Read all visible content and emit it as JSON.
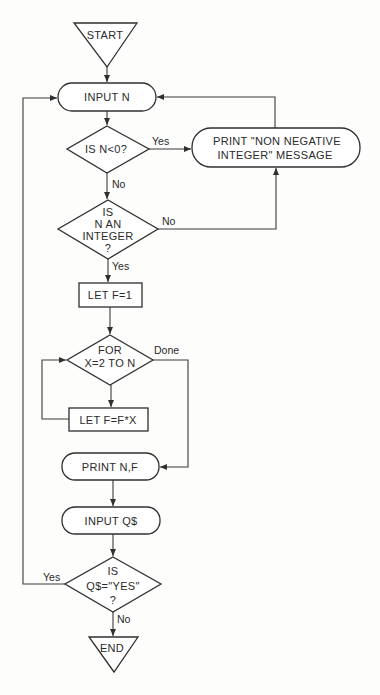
{
  "diagram": {
    "nodes": {
      "start": {
        "label": "START"
      },
      "input_n": {
        "label": "INPUT N"
      },
      "check_negative": {
        "label": "IS N<0?"
      },
      "print_message": {
        "lines": [
          "PRINT \"NON NEGATIVE",
          "INTEGER\" MESSAGE"
        ]
      },
      "check_integer": {
        "lines": [
          "IS",
          "N AN",
          "INTEGER",
          "?"
        ]
      },
      "let_f": {
        "label": "LET F=1"
      },
      "for_loop": {
        "lines": [
          "FOR",
          "X=2 TO N"
        ]
      },
      "let_ffx": {
        "label": "LET F=F*X"
      },
      "print_nf": {
        "label": "PRINT N,F"
      },
      "input_q": {
        "label": "INPUT Q$"
      },
      "check_yes": {
        "lines": [
          "IS",
          "Q$=\"YES\"",
          "?"
        ]
      },
      "end": {
        "label": "END"
      }
    },
    "edge_labels": {
      "negative_yes": "Yes",
      "negative_no": "No",
      "integer_no": "No",
      "integer_yes": "Yes",
      "for_done": "Done",
      "again_yes": "Yes",
      "again_no": "No"
    }
  }
}
